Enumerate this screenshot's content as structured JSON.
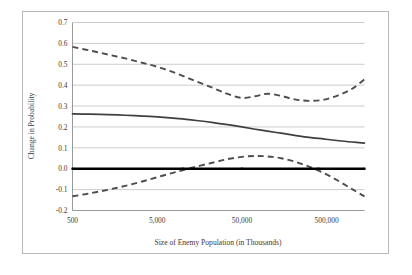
{
  "chart_data": {
    "type": "line",
    "title": "",
    "xlabel": "Size of Enemy Population (in Thousands)",
    "ylabel": "Change in Probability",
    "xscale": "log",
    "xlim": [
      500,
      1400000
    ],
    "ylim": [
      -0.2,
      0.7
    ],
    "yticks": [
      "0.7",
      "0.6",
      "0.5",
      "0.4",
      "0.3",
      "0.2",
      "0.1",
      "0.0",
      "-0.1",
      "-0.2"
    ],
    "ytick_values": [
      0.7,
      0.6,
      0.5,
      0.4,
      0.3,
      0.2,
      0.1,
      0.0,
      -0.1,
      -0.2
    ],
    "xticks": [
      "500",
      "5,000",
      "50,000",
      "500,000"
    ],
    "xtick_values": [
      500,
      5000,
      50000,
      500000
    ],
    "grid": "horizontal",
    "legend": "none",
    "series": [
      {
        "name": "Upper confidence bound",
        "style": "dashed",
        "color": "#4d4d4d",
        "x": [
          500,
          800,
          1300,
          2100,
          3400,
          5500,
          9000,
          14500,
          23000,
          34000,
          50000,
          72000,
          100000,
          145000,
          210000,
          310000,
          470000,
          700000,
          1000000,
          1400000
        ],
        "y": [
          0.583,
          0.566,
          0.547,
          0.528,
          0.506,
          0.483,
          0.452,
          0.418,
          0.386,
          0.358,
          0.339,
          0.347,
          0.359,
          0.349,
          0.332,
          0.325,
          0.331,
          0.353,
          0.383,
          0.428
        ]
      },
      {
        "name": "Point estimate",
        "style": "solid",
        "color": "#3f3f3f",
        "x": [
          500,
          800,
          1300,
          2100,
          3400,
          5500,
          9000,
          14500,
          23000,
          34000,
          50000,
          72000,
          100000,
          145000,
          210000,
          310000,
          470000,
          700000,
          1000000,
          1400000
        ],
        "y": [
          0.263,
          0.261,
          0.259,
          0.256,
          0.252,
          0.247,
          0.24,
          0.231,
          0.221,
          0.211,
          0.2,
          0.189,
          0.18,
          0.17,
          0.16,
          0.15,
          0.142,
          0.134,
          0.128,
          0.123
        ]
      },
      {
        "name": "Lower confidence bound",
        "style": "dashed",
        "color": "#4d4d4d",
        "x": [
          500,
          800,
          1300,
          2100,
          3400,
          5500,
          9000,
          14500,
          23000,
          34000,
          50000,
          72000,
          100000,
          145000,
          210000,
          310000,
          470000,
          700000,
          1000000,
          1400000
        ],
        "y": [
          -0.132,
          -0.118,
          -0.101,
          -0.082,
          -0.06,
          -0.036,
          -0.012,
          0.01,
          0.03,
          0.046,
          0.057,
          0.061,
          0.059,
          0.05,
          0.034,
          0.01,
          -0.022,
          -0.06,
          -0.098,
          -0.132
        ]
      },
      {
        "name": "Zero reference line",
        "style": "solid-thick",
        "color": "#000000",
        "x": [
          500,
          1400000
        ],
        "y": [
          0.0,
          0.0
        ]
      }
    ],
    "zero_line_markers": [
      500,
      10000,
      50000,
      400000,
      1400000
    ]
  },
  "icons": {
    "chart_frame": "chart-border"
  }
}
